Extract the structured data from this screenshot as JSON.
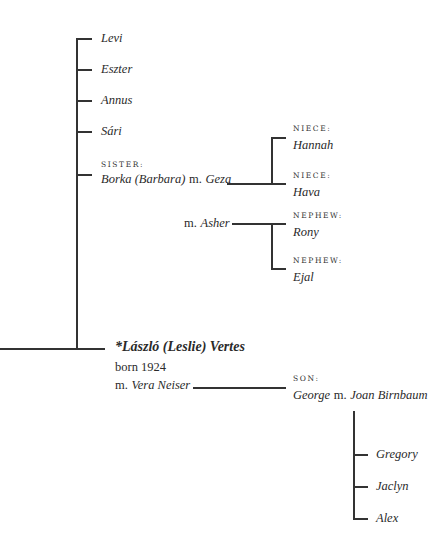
{
  "siblings": [
    {
      "name": "Levi"
    },
    {
      "name": "Eszter"
    },
    {
      "name": "Annus"
    },
    {
      "name": "Sári"
    }
  ],
  "sister": {
    "label": "SISTER:",
    "name": "Borka (Barbara)",
    "spouse_prefix": "m.",
    "spouse": "Geza",
    "children": [
      {
        "label": "NIECE:",
        "name": "Hannah"
      },
      {
        "label": "NIECE:",
        "name": "Hava"
      }
    ],
    "second_spouse_prefix": "m.",
    "second_spouse": "Asher",
    "second_children": [
      {
        "label": "NEPHEW:",
        "name": "Rony"
      },
      {
        "label": "NEPHEW:",
        "name": "Ejal"
      }
    ]
  },
  "subject": {
    "name": "*László (Leslie) Vertes",
    "born": "born 1924",
    "spouse_prefix": "m.",
    "spouse": "Vera Neiser"
  },
  "son": {
    "label": "SON:",
    "name": "George",
    "spouse_prefix": "m.",
    "spouse": "Joan Birnbaum",
    "children": [
      {
        "name": "Gregory"
      },
      {
        "name": "Jaclyn"
      },
      {
        "name": "Alex"
      }
    ]
  }
}
